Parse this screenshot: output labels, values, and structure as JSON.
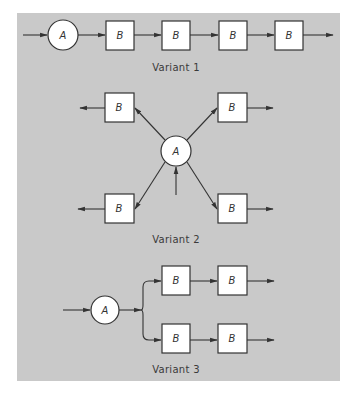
{
  "diagram": {
    "background_color": "#c9c9c9",
    "node_fill": "#ffffff",
    "stroke_color": "#333333",
    "variants": [
      {
        "label": "Variant 1",
        "description": "Serial chain: A feeds four B units in sequence",
        "nodes": {
          "source": "A",
          "units": [
            "B",
            "B",
            "B",
            "B"
          ]
        }
      },
      {
        "label": "Variant 2",
        "description": "Star: A at center distributes to four B units",
        "nodes": {
          "source": "A",
          "units": [
            "B",
            "B",
            "B",
            "B"
          ]
        }
      },
      {
        "label": "Variant 3",
        "description": "A splits into two parallel chains of two B units each",
        "nodes": {
          "source": "A",
          "units": [
            "B",
            "B",
            "B",
            "B"
          ]
        }
      }
    ]
  }
}
